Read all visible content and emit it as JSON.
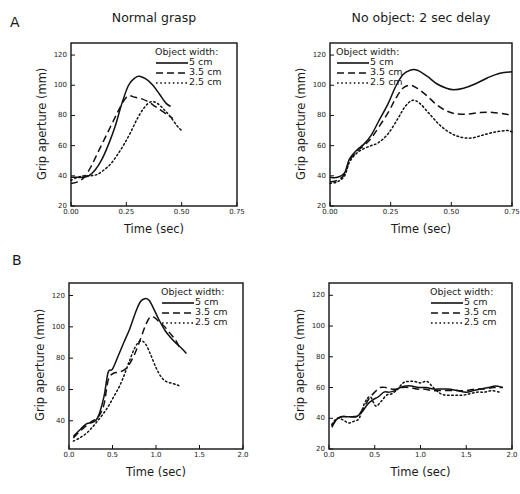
{
  "figure": {
    "panel_labels": [
      "A",
      "B"
    ],
    "column_titles": [
      "Normal grasp",
      "No object: 2 sec delay"
    ],
    "axis_titles": {
      "x": "Time (sec)",
      "y": "Grip aperture (mm)"
    },
    "legend": {
      "title": "Object width:",
      "entries": [
        {
          "label": "5 cm",
          "style": "solid"
        },
        {
          "label": "3.5 cm",
          "style": "dashed"
        },
        {
          "label": "2.5 cm",
          "style": "dotted"
        }
      ]
    }
  },
  "chart_data": [
    {
      "id": "panel-A-left",
      "type": "line",
      "title": "Normal grasp",
      "panel": "A",
      "xlabel": "Time (sec)",
      "ylabel": "Grip aperture (mm)",
      "xlim": [
        0.0,
        0.75
      ],
      "ylim": [
        20,
        128
      ],
      "xticks": [
        0.0,
        0.25,
        0.5,
        0.75
      ],
      "xticklabels": [
        "0.00",
        "0.25",
        "0.50",
        "0.75"
      ],
      "yticks": [
        20,
        40,
        60,
        80,
        100,
        120
      ],
      "yticklabels": [
        "20",
        "40",
        "60",
        "80",
        "100",
        "120"
      ],
      "grid": false,
      "legend_position": "upper-right",
      "series": [
        {
          "name": "5 cm",
          "style": "solid",
          "x": [
            0.0,
            0.02,
            0.05,
            0.08,
            0.11,
            0.14,
            0.17,
            0.2,
            0.23,
            0.26,
            0.29,
            0.31,
            0.34,
            0.37,
            0.4,
            0.43,
            0.45
          ],
          "values": [
            39,
            39,
            39,
            40,
            44,
            51,
            61,
            73,
            88,
            100,
            105,
            106,
            104,
            100,
            94,
            88,
            86
          ]
        },
        {
          "name": "3.5 cm",
          "style": "dashed",
          "x": [
            0.0,
            0.03,
            0.06,
            0.09,
            0.12,
            0.15,
            0.18,
            0.21,
            0.24,
            0.26,
            0.29,
            0.32,
            0.35,
            0.38,
            0.41,
            0.44,
            0.46
          ],
          "values": [
            35,
            36,
            39,
            46,
            55,
            64,
            73,
            82,
            90,
            93,
            92,
            91,
            89,
            86,
            83,
            80,
            78
          ]
        },
        {
          "name": "2.5 cm",
          "style": "dotted",
          "x": [
            0.0,
            0.03,
            0.06,
            0.09,
            0.12,
            0.15,
            0.18,
            0.21,
            0.24,
            0.27,
            0.3,
            0.33,
            0.36,
            0.39,
            0.42,
            0.45,
            0.48,
            0.5
          ],
          "values": [
            37,
            39,
            40,
            40,
            41,
            44,
            48,
            54,
            61,
            69,
            78,
            85,
            89,
            88,
            84,
            79,
            73,
            70
          ]
        }
      ]
    },
    {
      "id": "panel-A-right",
      "type": "line",
      "title": "No object: 2 sec delay",
      "panel": "A",
      "xlabel": "Time (sec)",
      "ylabel": "Grip aperture (mm)",
      "xlim": [
        0.0,
        0.75
      ],
      "ylim": [
        20,
        128
      ],
      "xticks": [
        0.0,
        0.25,
        0.5,
        0.75
      ],
      "xticklabels": [
        "0.00",
        "0.25",
        "0.50",
        "0.75"
      ],
      "yticks": [
        20,
        40,
        60,
        80,
        100,
        120
      ],
      "yticklabels": [
        "20",
        "40",
        "60",
        "80",
        "100",
        "120"
      ],
      "grid": false,
      "legend_position": "upper-left",
      "series": [
        {
          "name": "5 cm",
          "style": "solid",
          "x": [
            0.0,
            0.03,
            0.06,
            0.08,
            0.11,
            0.14,
            0.17,
            0.2,
            0.24,
            0.27,
            0.3,
            0.33,
            0.36,
            0.4,
            0.44,
            0.48,
            0.51,
            0.55,
            0.6,
            0.65,
            0.7,
            0.75
          ],
          "values": [
            39,
            39,
            42,
            51,
            57,
            61,
            67,
            76,
            88,
            99,
            107,
            110,
            110,
            106,
            101,
            98,
            97,
            98,
            101,
            105,
            108,
            109
          ]
        },
        {
          "name": "3.5 cm",
          "style": "dashed",
          "x": [
            0.0,
            0.03,
            0.06,
            0.08,
            0.11,
            0.14,
            0.17,
            0.2,
            0.24,
            0.27,
            0.3,
            0.33,
            0.36,
            0.4,
            0.44,
            0.48,
            0.52,
            0.57,
            0.62,
            0.67,
            0.72,
            0.75
          ],
          "values": [
            36,
            37,
            41,
            50,
            56,
            60,
            65,
            72,
            82,
            91,
            98,
            100,
            98,
            93,
            87,
            83,
            81,
            81,
            82,
            82,
            81,
            80
          ]
        },
        {
          "name": "2.5 cm",
          "style": "dotted",
          "x": [
            0.0,
            0.03,
            0.06,
            0.08,
            0.11,
            0.14,
            0.17,
            0.2,
            0.24,
            0.28,
            0.31,
            0.34,
            0.37,
            0.41,
            0.45,
            0.49,
            0.53,
            0.58,
            0.63,
            0.68,
            0.73,
            0.75
          ],
          "values": [
            35,
            36,
            40,
            49,
            55,
            58,
            60,
            62,
            68,
            78,
            86,
            90,
            88,
            81,
            74,
            69,
            66,
            65,
            67,
            69,
            70,
            69
          ]
        }
      ]
    },
    {
      "id": "panel-B-left",
      "type": "line",
      "title": "Normal grasp",
      "panel": "B",
      "xlabel": "Time (sec)",
      "ylabel": "Grip aperture (mm)",
      "xlim": [
        0.0,
        2.0
      ],
      "ylim": [
        22,
        128
      ],
      "xticks": [
        0.0,
        0.5,
        1.0,
        1.5,
        2.0
      ],
      "xticklabels": [
        "0.0",
        "0.5",
        "1.0",
        "1.5",
        "2.0"
      ],
      "yticks": [
        40,
        60,
        80,
        100,
        120
      ],
      "yticklabels": [
        "40",
        "60",
        "80",
        "100",
        "120"
      ],
      "grid": false,
      "legend_position": "upper-right",
      "series": [
        {
          "name": "5 cm",
          "style": "solid",
          "x": [
            0.05,
            0.12,
            0.2,
            0.27,
            0.33,
            0.4,
            0.45,
            0.5,
            0.57,
            0.63,
            0.7,
            0.77,
            0.82,
            0.87,
            0.92,
            0.97,
            1.03,
            1.1,
            1.17,
            1.24,
            1.3,
            1.35
          ],
          "values": [
            30,
            34,
            38,
            39,
            42,
            55,
            71,
            73,
            82,
            90,
            99,
            110,
            116,
            118,
            117,
            112,
            105,
            98,
            93,
            89,
            86,
            83
          ]
        },
        {
          "name": "3.5 cm",
          "style": "dashed",
          "x": [
            0.05,
            0.12,
            0.2,
            0.27,
            0.33,
            0.4,
            0.45,
            0.5,
            0.56,
            0.62,
            0.68,
            0.75,
            0.82,
            0.88,
            0.93,
            0.98,
            1.04,
            1.1,
            1.16,
            1.22,
            1.27
          ],
          "values": [
            29,
            33,
            37,
            40,
            42,
            50,
            66,
            70,
            71,
            72,
            75,
            82,
            92,
            101,
            106,
            106,
            103,
            100,
            96,
            92,
            87
          ]
        },
        {
          "name": "2.5 cm",
          "style": "dotted",
          "x": [
            0.05,
            0.12,
            0.2,
            0.27,
            0.33,
            0.4,
            0.46,
            0.52,
            0.58,
            0.64,
            0.7,
            0.76,
            0.82,
            0.88,
            0.94,
            1.0,
            1.06,
            1.12,
            1.18,
            1.24,
            1.28
          ],
          "values": [
            27,
            29,
            32,
            36,
            40,
            45,
            50,
            56,
            62,
            70,
            79,
            87,
            91,
            89,
            82,
            74,
            68,
            65,
            64,
            63,
            62
          ]
        }
      ]
    },
    {
      "id": "panel-B-right",
      "type": "line",
      "title": "No object: 2 sec delay",
      "panel": "B",
      "xlabel": "Time (sec)",
      "ylabel": "Grip aperture (mm)",
      "xlim": [
        0.0,
        2.0
      ],
      "ylim": [
        20,
        128
      ],
      "xticks": [
        0.0,
        0.5,
        1.0,
        1.5,
        2.0
      ],
      "xticklabels": [
        "0.0",
        "0.5",
        "1.0",
        "1.5",
        "2.0"
      ],
      "yticks": [
        20,
        40,
        60,
        80,
        100,
        120
      ],
      "yticklabels": [
        "20",
        "40",
        "60",
        "80",
        "100",
        "120"
      ],
      "grid": false,
      "legend_position": "upper-right",
      "series": [
        {
          "name": "5 cm",
          "style": "solid",
          "x": [
            0.03,
            0.08,
            0.13,
            0.18,
            0.24,
            0.3,
            0.36,
            0.42,
            0.48,
            0.54,
            0.6,
            0.66,
            0.72,
            0.78,
            0.84,
            0.9,
            0.98,
            1.06,
            1.14,
            1.22,
            1.3,
            1.4,
            1.5,
            1.58,
            1.66,
            1.74,
            1.82,
            1.9
          ],
          "values": [
            34,
            39,
            41,
            41,
            41,
            41,
            44,
            49,
            52,
            54,
            57,
            57,
            58,
            60,
            61,
            61,
            60,
            60,
            59,
            59,
            59,
            58,
            57,
            58,
            59,
            60,
            61,
            60
          ]
        },
        {
          "name": "3.5 cm",
          "style": "dashed",
          "x": [
            0.03,
            0.08,
            0.14,
            0.2,
            0.26,
            0.32,
            0.38,
            0.44,
            0.5,
            0.56,
            0.62,
            0.68,
            0.74,
            0.8,
            0.88,
            0.96,
            1.04,
            1.12,
            1.2,
            1.3,
            1.4,
            1.5,
            1.6,
            1.7,
            1.8,
            1.9
          ],
          "values": [
            35,
            39,
            41,
            41,
            41,
            42,
            47,
            53,
            57,
            60,
            60,
            59,
            59,
            60,
            60,
            59,
            59,
            58,
            58,
            58,
            58,
            58,
            59,
            59,
            60,
            60
          ]
        },
        {
          "name": "2.5 cm",
          "style": "dotted",
          "x": [
            0.03,
            0.09,
            0.15,
            0.21,
            0.27,
            0.33,
            0.39,
            0.45,
            0.51,
            0.57,
            0.63,
            0.69,
            0.75,
            0.81,
            0.87,
            0.93,
            1.0,
            1.07,
            1.14,
            1.22,
            1.3,
            1.38,
            1.46,
            1.54,
            1.62,
            1.7,
            1.78,
            1.86
          ],
          "values": [
            36,
            40,
            39,
            37,
            38,
            40,
            50,
            54,
            48,
            51,
            55,
            56,
            59,
            63,
            64,
            64,
            63,
            64,
            60,
            56,
            55,
            55,
            55,
            56,
            57,
            57,
            58,
            57
          ]
        }
      ]
    }
  ]
}
